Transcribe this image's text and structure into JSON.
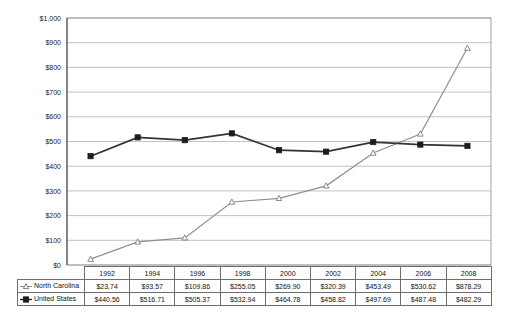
{
  "chart_data": {
    "type": "line",
    "title": "",
    "subtitle": "",
    "xlabel": "",
    "ylabel": "",
    "categories": [
      "1992",
      "1994",
      "1996",
      "1998",
      "2000",
      "2002",
      "2004",
      "2006",
      "2008"
    ],
    "series": [
      {
        "name": "North Carolina",
        "marker": "hollow-triangle",
        "color": "#8f8f8f",
        "values": [
          23.74,
          93.57,
          109.86,
          255.05,
          269.9,
          320.39,
          453.49,
          530.62,
          878.29
        ],
        "labels": [
          "$23.74",
          "$93.57",
          "$109.86",
          "$255.05",
          "$269.90",
          "$320.39",
          "$453.49",
          "$530.62",
          "$878.29"
        ]
      },
      {
        "name": "United States",
        "marker": "filled-square",
        "color": "#1c1c1c",
        "values": [
          440.56,
          516.71,
          505.37,
          532.94,
          464.78,
          458.82,
          497.69,
          487.48,
          482.29
        ],
        "labels": [
          "$440.56",
          "$516.71",
          "$505.37",
          "$532.94",
          "$464.78",
          "$458.82",
          "$497.69",
          "$487.48",
          "$482.29"
        ]
      }
    ],
    "ylim": [
      0,
      1000
    ],
    "ytick_values": [
      0,
      100,
      200,
      300,
      400,
      500,
      600,
      700,
      800,
      900,
      1000
    ],
    "ytick_labels": [
      "$0",
      "$100",
      "$200",
      "$300",
      "$400",
      "$500",
      "$600",
      "$700",
      "$800",
      "$900",
      "$1,000"
    ],
    "grid": true,
    "legend_position": "data-table-row-labels"
  },
  "table": {
    "corner_label": "",
    "year_headers": [
      "1992",
      "1994",
      "1996",
      "1998",
      "2000",
      "2002",
      "2004",
      "2006",
      "2008"
    ],
    "rows": [
      {
        "label": "North Carolina",
        "marker": "hollow-triangle",
        "cells": [
          "$23.74",
          "$93.57",
          "$109.86",
          "$255.05",
          "$269.90",
          "$320.39",
          "$453.49",
          "$530.62",
          "$878.29"
        ]
      },
      {
        "label": "United States",
        "marker": "filled-square",
        "cells": [
          "$440.56",
          "$516.71",
          "$505.37",
          "$532.94",
          "$464.78",
          "$458.82",
          "$497.69",
          "$487.48",
          "$482.29"
        ]
      }
    ]
  },
  "colors": {
    "north_carolina": "#8f8f8f",
    "united_states": "#1c1c1c",
    "gridline": "#a8a8a8",
    "frame": "#8c8c8c",
    "background": "#ffffff"
  }
}
